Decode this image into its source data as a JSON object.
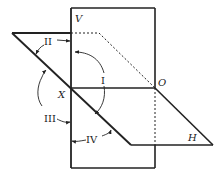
{
  "diagram": {
    "title": "",
    "planes": {
      "vertical": {
        "label": "V"
      },
      "horizontal": {
        "label": "H"
      }
    },
    "axis": {
      "left_label": "X",
      "right_label": "O"
    },
    "quadrants": [
      {
        "id": "I",
        "label": "I"
      },
      {
        "id": "II",
        "label": "II"
      },
      {
        "id": "III",
        "label": "III"
      },
      {
        "id": "IV",
        "label": "IV"
      }
    ],
    "colors": {
      "line": "#222222",
      "background": "#ffffff"
    }
  }
}
